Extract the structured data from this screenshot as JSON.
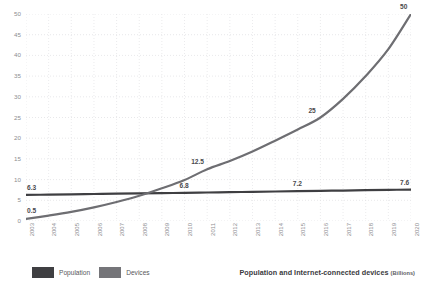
{
  "chart_data": {
    "type": "line",
    "title": "Population and Internet-connected devices",
    "title_unit": "(Billions)",
    "xlabel": "",
    "ylabel": "",
    "xlim": [
      2003,
      2020
    ],
    "ylim": [
      0,
      50
    ],
    "grid": true,
    "legend_position": "bottom-left",
    "categories": [
      2003,
      2004,
      2005,
      2006,
      2007,
      2008,
      2009,
      2010,
      2011,
      2012,
      2013,
      2014,
      2015,
      2016,
      2017,
      2018,
      2019,
      2020
    ],
    "x_tick_labels": [
      "2003",
      "2004",
      "2005",
      "2006",
      "2007",
      "2008",
      "2009",
      "2010",
      "2011",
      "2012",
      "2013",
      "2014",
      "2015",
      "2016",
      "2017",
      "2018",
      "2019",
      "2020"
    ],
    "y_tick_labels": [
      "0",
      "5",
      "10",
      "15",
      "20",
      "25",
      "30",
      "35",
      "40",
      "45",
      "50"
    ],
    "y_ticks": [
      0,
      5,
      10,
      15,
      20,
      25,
      30,
      35,
      40,
      45,
      50
    ],
    "series": [
      {
        "name": "Population",
        "color": "#3f3f42",
        "values": [
          6.3,
          6.37,
          6.45,
          6.52,
          6.6,
          6.67,
          6.74,
          6.8,
          6.88,
          6.96,
          7.04,
          7.12,
          7.2,
          7.28,
          7.36,
          7.44,
          7.52,
          7.6
        ],
        "point_labels": [
          {
            "x": 2003,
            "y": 6.3,
            "text": "6.3"
          },
          {
            "x": 2010,
            "y": 6.8,
            "text": "6.8"
          },
          {
            "x": 2015,
            "y": 7.2,
            "text": "7.2"
          },
          {
            "x": 2020,
            "y": 7.6,
            "text": "7.6"
          }
        ]
      },
      {
        "name": "Devices",
        "color": "#6e6e72",
        "values": [
          0.5,
          1.3,
          2.2,
          3.3,
          4.6,
          6.1,
          7.9,
          9.9,
          12.5,
          14.5,
          16.8,
          19.4,
          22.1,
          25.0,
          29.5,
          35.0,
          41.5,
          50.0
        ],
        "point_labels": [
          {
            "x": 2003,
            "y": 0.5,
            "text": "0.5"
          },
          {
            "x": 2011,
            "y": 12.5,
            "text": "12.5"
          },
          {
            "x": 2016,
            "y": 25,
            "text": "25"
          },
          {
            "x": 2020,
            "y": 50,
            "text": "50"
          }
        ]
      }
    ],
    "legend": [
      {
        "label": "Population",
        "color": "#3f3f42"
      },
      {
        "label": "Devices",
        "color": "#757579"
      }
    ]
  }
}
